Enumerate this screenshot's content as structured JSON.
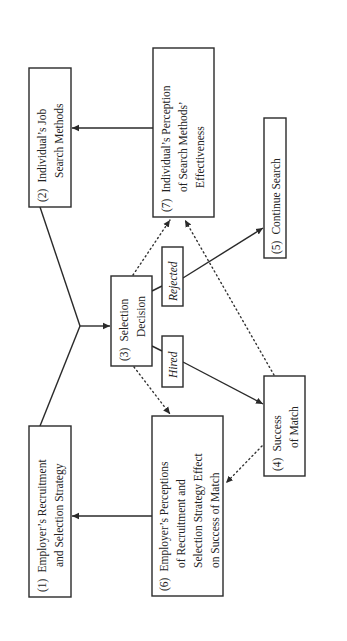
{
  "diagram": {
    "orientation": "rotated-90-ccw",
    "nodes": [
      {
        "id": "1",
        "number": "(1)",
        "lines": [
          "Employer’s Recruitment",
          "and Selection Strategy"
        ]
      },
      {
        "id": "2",
        "number": "(2)",
        "lines": [
          "Individual’s Job",
          "Search Methods"
        ]
      },
      {
        "id": "3",
        "number": "(3)",
        "lines": [
          "Selection",
          "Decision"
        ]
      },
      {
        "id": "4",
        "number": "(4)",
        "lines": [
          "Success",
          "of Match"
        ]
      },
      {
        "id": "5",
        "number": "(5)",
        "lines": [
          "Continue Search"
        ]
      },
      {
        "id": "6",
        "number": "(6)",
        "lines": [
          "Employer’s Perceptions",
          "of Recruitment and",
          "Selection Strategy Effect",
          "on Success of Match"
        ]
      },
      {
        "id": "7",
        "number": "(7)",
        "lines": [
          "Individual’s Perception",
          "of Search Methods’",
          "Effectiveness"
        ]
      }
    ],
    "edge_labels": {
      "rejected": "Rejected",
      "hired": "Hired"
    },
    "edges": [
      {
        "from": "1+2",
        "to": "3",
        "style": "solid"
      },
      {
        "from": "3",
        "to": "5",
        "style": "solid",
        "label": "Rejected"
      },
      {
        "from": "3",
        "to": "4",
        "style": "solid",
        "label": "Hired"
      },
      {
        "from": "3",
        "to": "7",
        "style": "dotted"
      },
      {
        "from": "4",
        "to": "7",
        "style": "dotted"
      },
      {
        "from": "3",
        "to": "6",
        "style": "dotted"
      },
      {
        "from": "4",
        "to": "6",
        "style": "dotted"
      },
      {
        "from": "7",
        "to": "2",
        "style": "solid"
      },
      {
        "from": "6",
        "to": "1",
        "style": "solid"
      }
    ]
  }
}
